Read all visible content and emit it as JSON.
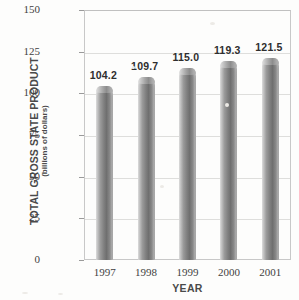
{
  "chart_data": {
    "type": "bar",
    "title": "",
    "xlabel": "YEAR",
    "ylabel": "TOTAL GROSS STATE PRODUCT",
    "ylabel_sub": "(billions of dollars)",
    "categories": [
      "1997",
      "1998",
      "1999",
      "2000",
      "2001"
    ],
    "values": [
      104.2,
      109.7,
      115.0,
      119.3,
      121.5
    ],
    "value_labels": [
      "104.2",
      "109.7",
      "115.0",
      "119.3",
      "121.5"
    ],
    "ylim": [
      0,
      150
    ],
    "yticks": [
      0,
      25,
      50,
      75,
      100,
      125,
      150
    ],
    "ytick_labels": [
      "0",
      "25",
      "50",
      "75",
      "100",
      "125",
      "150"
    ],
    "grid": true,
    "legend": null,
    "series": [
      {
        "name": "Total Gross State Product",
        "values": [
          104.2,
          109.7,
          115.0,
          119.3,
          121.5
        ]
      }
    ],
    "colors": {
      "bar_light": "#d8d8d8",
      "bar_mid": "#9a9a9a",
      "bar_dark": "#6f6f6f",
      "axis": "#c8c8c8",
      "grid": "#dededc",
      "text": "#3f3f3f",
      "background": "#fdfdfc"
    }
  }
}
